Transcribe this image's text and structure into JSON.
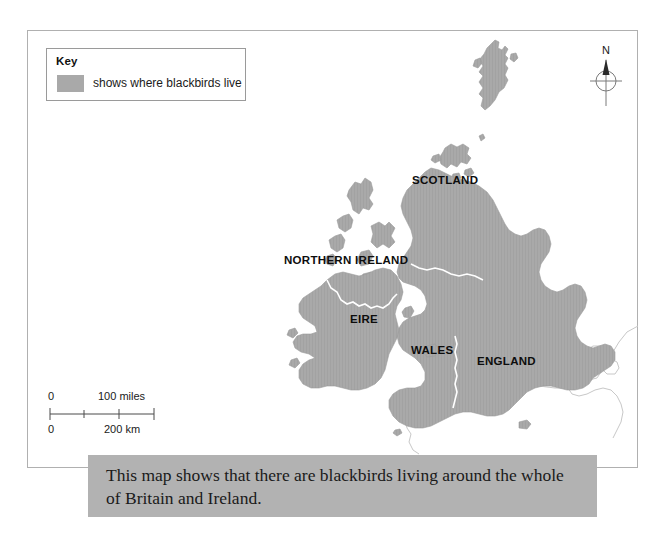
{
  "map": {
    "key": {
      "title": "Key",
      "swatch_color": "#a9a9a9",
      "label": "shows where blackbirds live"
    },
    "compass": {
      "north_label": "N"
    },
    "scale": {
      "miles_start": "0",
      "miles_end": "100 miles",
      "km_start": "0",
      "km_end": "200 km"
    },
    "labels": {
      "scotland": "SCOTLAND",
      "northern_ireland": "NORTHERN IRELAND",
      "eire": "EIRE",
      "wales": "WALES",
      "england": "ENGLAND"
    },
    "land_fill_color": "#a9a9a9",
    "frame_color": "#b0b0b0",
    "background_color": "#ffffff"
  },
  "caption": {
    "text": "This map shows that there are blackbirds living around the whole of Britain and Ireland.",
    "band_color": "#b2b2b2"
  }
}
